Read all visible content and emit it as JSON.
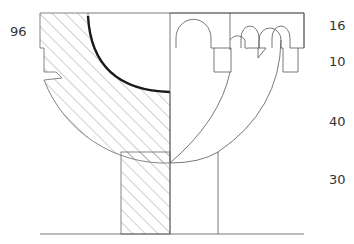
{
  "diagram": {
    "type": "architectural-section",
    "colors": {
      "line": "#555555",
      "heavy_line": "#1a1a1a",
      "hatch": "#888888",
      "text": "#333333"
    },
    "labels": {
      "left_dimension": "96",
      "right_dimensions": [
        "16",
        "10",
        "40",
        "30"
      ]
    }
  }
}
